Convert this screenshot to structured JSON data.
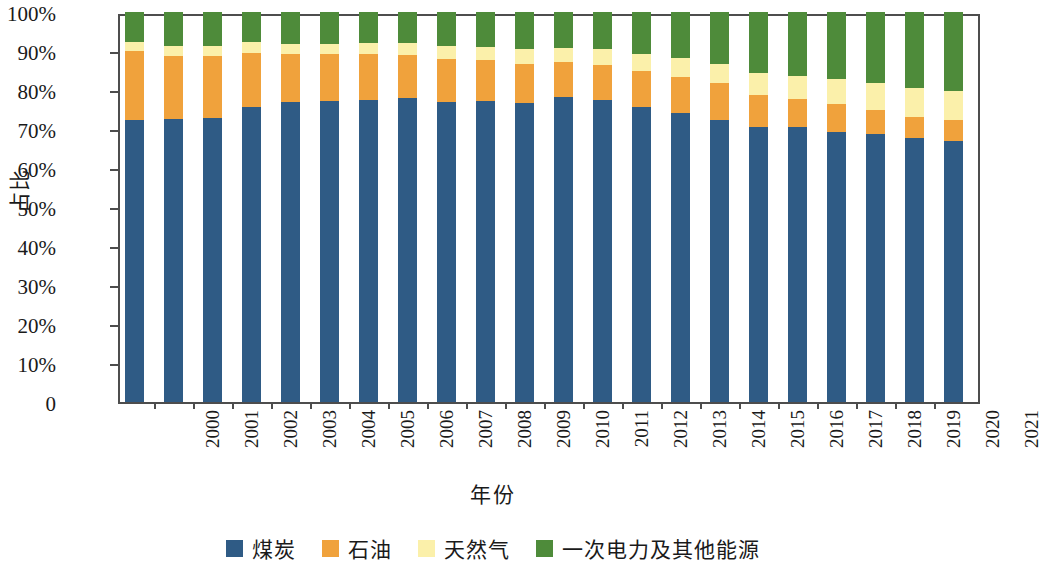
{
  "chart_data": {
    "type": "bar",
    "subtype": "stacked-percentage-column",
    "title": "",
    "xlabel": "年份",
    "ylabel": "占比",
    "ylim": [
      0,
      100
    ],
    "ytick_labels": [
      "0",
      "10%",
      "20%",
      "30%",
      "40%",
      "50%",
      "60%",
      "70%",
      "80%",
      "90%",
      "100%"
    ],
    "ytick_values": [
      0,
      10,
      20,
      30,
      40,
      50,
      60,
      70,
      80,
      90,
      100
    ],
    "grid": false,
    "legend_position": "bottom",
    "categories": [
      "2000",
      "2001",
      "2002",
      "2003",
      "2004",
      "2005",
      "2006",
      "2007",
      "2008",
      "2009",
      "2010",
      "2011",
      "2012",
      "2013",
      "2014",
      "2015",
      "2016",
      "2017",
      "2018",
      "2019",
      "2020",
      "2021"
    ],
    "series": [
      {
        "name": "煤炭",
        "color": "#2f5b85",
        "values": [
          72.4,
          72.5,
          72.8,
          75.7,
          77.0,
          77.3,
          77.4,
          77.9,
          76.9,
          77.1,
          76.6,
          78.2,
          77.4,
          75.7,
          74.1,
          72.4,
          70.6,
          70.4,
          69.3,
          68.6,
          67.6,
          67.0
        ]
      },
      {
        "name": "石油",
        "color": "#f0a23c",
        "values": [
          17.6,
          16.3,
          16.0,
          13.9,
          12.3,
          12.0,
          11.9,
          11.1,
          11.0,
          10.5,
          10.1,
          8.9,
          8.9,
          9.1,
          9.3,
          9.4,
          8.1,
          7.3,
          7.0,
          6.3,
          5.6,
          5.3
        ]
      },
      {
        "name": "天然气",
        "color": "#fbf0aa",
        "values": [
          2.4,
          2.5,
          2.5,
          2.6,
          2.6,
          2.6,
          2.8,
          3.1,
          3.4,
          3.5,
          3.8,
          3.6,
          4.1,
          4.4,
          4.7,
          4.9,
          5.7,
          6.0,
          6.5,
          6.9,
          7.2,
          7.5
        ]
      },
      {
        "name": "一次电力及其他能源",
        "color": "#4e8b3a",
        "values": [
          7.6,
          8.7,
          8.7,
          7.8,
          8.1,
          8.1,
          7.9,
          7.9,
          8.7,
          8.9,
          9.5,
          9.3,
          9.6,
          10.8,
          11.9,
          13.3,
          15.6,
          16.3,
          17.2,
          18.2,
          19.6,
          20.2
        ]
      }
    ]
  },
  "axis": {
    "ylabel": "占比",
    "xlabel": "年份"
  },
  "legend": {
    "items": [
      {
        "label": "煤炭",
        "color": "#2f5b85"
      },
      {
        "label": "石油",
        "color": "#f0a23c"
      },
      {
        "label": "天然气",
        "color": "#fbf0aa"
      },
      {
        "label": "一次电力及其他能源",
        "color": "#4e8b3a"
      }
    ]
  },
  "colors": {
    "coal": "#2f5b85",
    "oil": "#f0a23c",
    "gas": "#fbf0aa",
    "primary_electricity": "#4e8b3a",
    "axis": "#4d4d4d",
    "text": "#1a1a1a",
    "background": "#ffffff"
  }
}
